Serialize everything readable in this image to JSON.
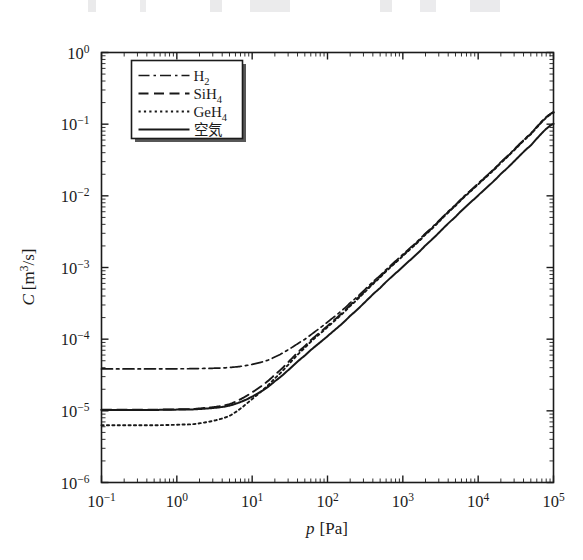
{
  "chart_data": {
    "type": "line",
    "title": "",
    "xlabel": "p [Pa]",
    "ylabel": "C [m^3/s]",
    "xscale": "log",
    "yscale": "log",
    "xlim": [
      0.1,
      100000
    ],
    "ylim": [
      1e-06,
      1
    ],
    "grid": false,
    "legend_position": "upper left",
    "x_tick_labels": [
      "10-1",
      "100",
      "101",
      "102",
      "103",
      "104",
      "105"
    ],
    "x_tick_values": [
      0.1,
      1,
      10,
      100,
      1000,
      10000,
      100000
    ],
    "y_tick_labels": [
      "100",
      "10-1",
      "10-2",
      "10-3",
      "10-4",
      "10-5",
      "10-6"
    ],
    "y_tick_values": [
      1,
      0.1,
      0.01,
      0.001,
      0.0001,
      1e-05,
      1e-06
    ],
    "x": [
      0.1,
      0.2,
      0.5,
      1,
      2,
      5,
      10,
      20,
      50,
      100,
      200,
      500,
      1000,
      2000,
      5000,
      10000,
      20000,
      50000,
      100000
    ],
    "series": [
      {
        "name": "H2",
        "label_parts": {
          "base": "H",
          "sub": "2"
        },
        "dash": "dash-dot",
        "dasharray": "11,4,2.5,4",
        "width": 1.7,
        "plateau": 3.85e-05,
        "values": [
          3.85e-05,
          3.85e-05,
          3.85e-05,
          3.86e-05,
          3.89e-05,
          4.02e-05,
          4.45e-05,
          5.65e-05,
          9.95e-05,
          0.000173,
          0.000322,
          0.000772,
          0.00152,
          0.00301,
          0.00747,
          0.0149,
          0.0297,
          0.0742,
          0.148
        ]
      },
      {
        "name": "SiH4",
        "label_parts": {
          "base": "SiH",
          "sub": "4"
        },
        "dash": "dashed",
        "dasharray": "10,5.5",
        "width": 1.9,
        "plateau": 1.04e-05,
        "values": [
          1.04e-05,
          1.04e-05,
          1.04e-05,
          1.05e-05,
          1.08e-05,
          1.24e-05,
          1.81e-05,
          3.2e-05,
          8e-05,
          0.000153,
          0.0003,
          0.000742,
          0.001475,
          0.00294,
          0.00734,
          0.01466,
          0.0293,
          0.0732,
          0.1464
        ]
      },
      {
        "name": "GeH4",
        "label_parts": {
          "base": "GeH",
          "sub": "4"
        },
        "dash": "dotted",
        "dasharray": "2.2,3.2",
        "width": 1.9,
        "plateau": 6.3e-06,
        "values": [
          6.3e-06,
          6.3e-06,
          6.3e-06,
          6.4e-06,
          6.7e-06,
          8.5e-06,
          1.46e-05,
          2.85e-05,
          7.55e-05,
          0.000147,
          0.000291,
          0.000726,
          0.001448,
          0.00289,
          0.00723,
          0.01446,
          0.0289,
          0.0723,
          0.1446
        ]
      },
      {
        "name": "air",
        "label_parts": {
          "base": "空気",
          "sub": ""
        },
        "dash": "solid",
        "dasharray": "",
        "width": 2.0,
        "plateau": 1.03e-05,
        "values": [
          1.03e-05,
          1.03e-05,
          1.03e-05,
          1.04e-05,
          1.06e-05,
          1.18e-05,
          1.58e-05,
          2.59e-05,
          5.9e-05,
          0.00011,
          0.000212,
          0.000518,
          0.001025,
          0.00204,
          0.00508,
          0.01014,
          0.02026,
          0.05062,
          0.1012
        ]
      }
    ]
  },
  "legend": {
    "entries": [
      {
        "label": "H2",
        "base": "H",
        "sub": "2",
        "style": "dash-dot"
      },
      {
        "label": "SiH4",
        "base": "SiH",
        "sub": "4",
        "style": "dashed"
      },
      {
        "label": "GeH4",
        "base": "GeH",
        "sub": "4",
        "style": "dotted"
      },
      {
        "label": "空気",
        "base": "空気",
        "sub": "",
        "style": "solid"
      }
    ]
  },
  "axes": {
    "x_title_var": "p",
    "x_title_unit": "[Pa]",
    "y_title_var": "C",
    "y_title_unit_open": "[m",
    "y_title_unit_sup": "3",
    "y_title_unit_close": "/s]"
  },
  "colors": {
    "ink": "#181818",
    "background": "#ffffff"
  }
}
